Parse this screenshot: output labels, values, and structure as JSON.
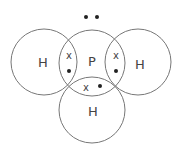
{
  "diagram": {
    "type": "dot-and-cross",
    "molecule": "PH3",
    "atoms": [
      {
        "id": "H_left",
        "symbol": "H"
      },
      {
        "id": "P_center",
        "symbol": "P"
      },
      {
        "id": "H_right",
        "symbol": "H"
      },
      {
        "id": "H_bottom",
        "symbol": "H"
      }
    ],
    "lone_pair": {
      "on": "P",
      "electrons": [
        "dot",
        "dot"
      ]
    },
    "bonds": [
      {
        "between": [
          "H_left",
          "P_center"
        ],
        "electrons": [
          {
            "symbol": "x"
          },
          {
            "symbol": "dot"
          }
        ]
      },
      {
        "between": [
          "H_right",
          "P_center"
        ],
        "electrons": [
          {
            "symbol": "x"
          },
          {
            "symbol": "dot"
          }
        ]
      },
      {
        "between": [
          "H_bottom",
          "P_center"
        ],
        "electrons": [
          {
            "symbol": "x"
          },
          {
            "symbol": "dot"
          }
        ]
      }
    ],
    "cross_glyph": "x"
  }
}
